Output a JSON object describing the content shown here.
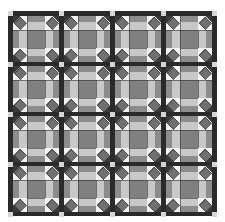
{
  "image": {
    "subject": "quilt-pattern",
    "rows": 4,
    "cols": 4
  },
  "colors": {
    "sashing": "#2a2a2a",
    "cornerstone": "#d6d6d6",
    "diamond": "#707070",
    "diamond_outline": "#333333",
    "corner_triangle": "#3a3a3a",
    "background_light": "#f2f2f2",
    "bar_medium": "#8c8c8c",
    "strip_light": "#c8c8c8",
    "center": "#808080",
    "seam": "#333333"
  },
  "layout": {
    "block_size": 46,
    "sashing_width": 5,
    "x_offsets": [
      5,
      56,
      107,
      158
    ],
    "y_offsets": [
      5,
      55,
      105,
      155
    ]
  }
}
